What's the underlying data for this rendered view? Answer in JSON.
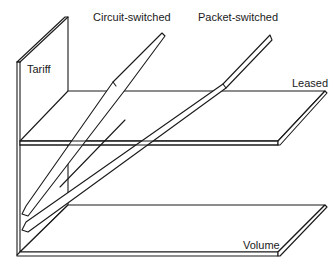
{
  "diagram": {
    "type": "3d-surface-sketch",
    "labels": {
      "circuit_switched": "Circuit-switched",
      "packet_switched": "Packet-switched",
      "tariff": "Tariff",
      "leased": "Leased",
      "volume": "Volume"
    },
    "axes": {
      "vertical": "Tariff",
      "horizontal": "Volume"
    },
    "planes": [
      {
        "name": "Leased",
        "shape": "flat horizontal plane at intermediate tariff"
      },
      {
        "name": "Circuit-switched",
        "shape": "thin plane rising steeply with volume"
      },
      {
        "name": "Packet-switched",
        "shape": "thin plane rising less steeply with volume"
      }
    ],
    "colors": {
      "ink": "#1a1a1a",
      "paper": "#ffffff"
    }
  }
}
